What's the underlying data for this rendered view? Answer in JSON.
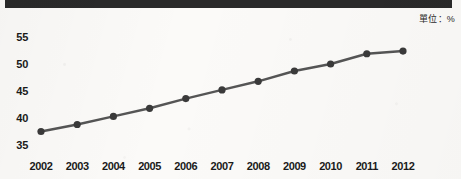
{
  "unit_note": "單位：%",
  "chart_data": {
    "type": "line",
    "title": "",
    "xlabel": "",
    "ylabel": "",
    "categories": [
      "2002",
      "2003",
      "2004",
      "2005",
      "2006",
      "2007",
      "2008",
      "2009",
      "2010",
      "2011",
      "2012"
    ],
    "values": [
      37.5,
      38.8,
      40.3,
      41.8,
      43.6,
      45.2,
      46.8,
      48.7,
      50.0,
      51.9,
      52.4
    ],
    "series": [
      {
        "name": "",
        "values": [
          37.5,
          38.8,
          40.3,
          41.8,
          43.6,
          45.2,
          46.8,
          48.7,
          50.0,
          51.9,
          52.4
        ]
      }
    ],
    "y_ticks": [
      35,
      40,
      45,
      50,
      55
    ],
    "ylim": [
      35,
      55
    ],
    "grid": false,
    "legend": "none",
    "line_color": "#555555",
    "marker_color": "#3a3a3a",
    "marker": "circle"
  },
  "decor": {
    "top_bar_color": "#2a2a2a"
  }
}
